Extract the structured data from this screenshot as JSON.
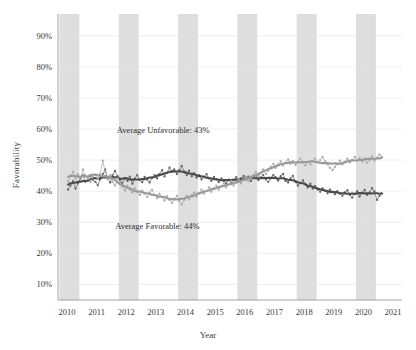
{
  "chart_data": {
    "type": "line",
    "title": "",
    "xlabel": "Year",
    "ylabel": "Favorability",
    "xlim": [
      2009.7,
      2021.3
    ],
    "ylim": [
      0.05,
      0.97
    ],
    "grid": true,
    "legend_position": "none",
    "ytick_labels": [
      "90%",
      "80%",
      "70%",
      "60%",
      "50%",
      "40%",
      "30%",
      "20%",
      "10%"
    ],
    "ytick_values": [
      0.9,
      0.8,
      0.7,
      0.6,
      0.5,
      0.4,
      0.3,
      0.2,
      0.1
    ],
    "xtick_labels": [
      "2010",
      "2011",
      "2012",
      "2013",
      "2014",
      "2015",
      "2016",
      "2017",
      "2018",
      "2019",
      "2020",
      "2021"
    ],
    "xtick_values": [
      2010,
      2011,
      2012,
      2013,
      2014,
      2015,
      2016,
      2017,
      2018,
      2019,
      2020,
      2021
    ],
    "shaded_bands": [
      {
        "start": 2009.75,
        "end": 2010.42
      },
      {
        "start": 2011.75,
        "end": 2012.42
      },
      {
        "start": 2013.75,
        "end": 2014.42
      },
      {
        "start": 2015.75,
        "end": 2016.42
      },
      {
        "start": 2017.75,
        "end": 2018.42
      },
      {
        "start": 2019.75,
        "end": 2020.42
      }
    ],
    "band_color": "#c9c9c9",
    "annotations": [
      {
        "text": "Average Unfavorable: 43%",
        "x": 2013.25,
        "y": 0.595
      },
      {
        "text": "Average Favorable: 44%",
        "x": 2013.05,
        "y": 0.285
      }
    ],
    "series": [
      {
        "name": "Unfavorable",
        "color": "#5d5d5d",
        "smooth_color": "#4a4a4a",
        "marker": "circle",
        "x": [
          2010.04,
          2010.12,
          2010.21,
          2010.29,
          2010.37,
          2010.46,
          2010.54,
          2010.62,
          2010.71,
          2010.79,
          2010.87,
          2010.96,
          2011.04,
          2011.12,
          2011.21,
          2011.29,
          2011.37,
          2011.46,
          2011.54,
          2011.62,
          2011.71,
          2011.79,
          2011.87,
          2011.96,
          2012.04,
          2012.12,
          2012.21,
          2012.29,
          2012.37,
          2012.46,
          2012.54,
          2012.62,
          2012.71,
          2012.79,
          2012.87,
          2012.96,
          2013.04,
          2013.12,
          2013.21,
          2013.29,
          2013.37,
          2013.46,
          2013.54,
          2013.62,
          2013.71,
          2013.79,
          2013.87,
          2013.96,
          2014.04,
          2014.12,
          2014.21,
          2014.29,
          2014.37,
          2014.46,
          2014.54,
          2014.62,
          2014.71,
          2014.79,
          2014.87,
          2014.96,
          2015.04,
          2015.12,
          2015.21,
          2015.29,
          2015.37,
          2015.46,
          2015.54,
          2015.62,
          2015.71,
          2015.79,
          2015.87,
          2015.96,
          2016.04,
          2016.12,
          2016.21,
          2016.29,
          2016.37,
          2016.46,
          2016.54,
          2016.62,
          2016.71,
          2016.79,
          2016.87,
          2016.96,
          2017.04,
          2017.12,
          2017.21,
          2017.29,
          2017.37,
          2017.46,
          2017.54,
          2017.62,
          2017.71,
          2017.79,
          2017.87,
          2017.96,
          2018.04,
          2018.12,
          2018.21,
          2018.29,
          2018.37,
          2018.46,
          2018.54,
          2018.62,
          2018.71,
          2018.79,
          2018.87,
          2018.96,
          2019.04,
          2019.12,
          2019.21,
          2019.29,
          2019.37,
          2019.46,
          2019.54,
          2019.62,
          2019.71,
          2019.79,
          2019.87,
          2019.96,
          2020.04,
          2020.12,
          2020.21,
          2020.29,
          2020.37,
          2020.46,
          2020.54,
          2020.62
        ],
        "y": [
          0.405,
          0.418,
          0.432,
          0.408,
          0.425,
          0.44,
          0.452,
          0.43,
          0.441,
          0.449,
          0.437,
          0.43,
          0.419,
          0.438,
          0.455,
          0.47,
          0.441,
          0.428,
          0.452,
          0.465,
          0.448,
          0.436,
          0.427,
          0.441,
          0.433,
          0.447,
          0.424,
          0.44,
          0.452,
          0.436,
          0.429,
          0.446,
          0.437,
          0.428,
          0.443,
          0.452,
          0.441,
          0.455,
          0.468,
          0.447,
          0.459,
          0.476,
          0.462,
          0.47,
          0.455,
          0.468,
          0.481,
          0.463,
          0.452,
          0.466,
          0.448,
          0.457,
          0.444,
          0.452,
          0.438,
          0.447,
          0.455,
          0.441,
          0.433,
          0.446,
          0.438,
          0.429,
          0.441,
          0.433,
          0.425,
          0.437,
          0.428,
          0.436,
          0.445,
          0.432,
          0.441,
          0.449,
          0.438,
          0.447,
          0.433,
          0.442,
          0.451,
          0.436,
          0.444,
          0.452,
          0.438,
          0.43,
          0.441,
          0.452,
          0.445,
          0.434,
          0.448,
          0.456,
          0.433,
          0.428,
          0.441,
          0.449,
          0.43,
          0.418,
          0.426,
          0.435,
          0.422,
          0.412,
          0.424,
          0.408,
          0.416,
          0.405,
          0.398,
          0.409,
          0.401,
          0.393,
          0.405,
          0.398,
          0.39,
          0.4,
          0.392,
          0.385,
          0.396,
          0.403,
          0.388,
          0.379,
          0.391,
          0.4,
          0.383,
          0.395,
          0.404,
          0.388,
          0.396,
          0.41,
          0.399,
          0.372,
          0.385,
          0.393
        ]
      },
      {
        "name": "Favorable",
        "color": "#a8a8a8",
        "smooth_color": "#999999",
        "marker": "circle",
        "x": [
          2010.04,
          2010.12,
          2010.21,
          2010.29,
          2010.37,
          2010.46,
          2010.54,
          2010.62,
          2010.71,
          2010.79,
          2010.87,
          2010.96,
          2011.04,
          2011.12,
          2011.21,
          2011.29,
          2011.37,
          2011.46,
          2011.54,
          2011.62,
          2011.71,
          2011.79,
          2011.87,
          2011.96,
          2012.04,
          2012.12,
          2012.21,
          2012.29,
          2012.37,
          2012.46,
          2012.54,
          2012.62,
          2012.71,
          2012.79,
          2012.87,
          2012.96,
          2013.04,
          2013.12,
          2013.21,
          2013.29,
          2013.37,
          2013.46,
          2013.54,
          2013.62,
          2013.71,
          2013.79,
          2013.87,
          2013.96,
          2014.04,
          2014.12,
          2014.21,
          2014.29,
          2014.37,
          2014.46,
          2014.54,
          2014.62,
          2014.71,
          2014.79,
          2014.87,
          2014.96,
          2015.04,
          2015.12,
          2015.21,
          2015.29,
          2015.37,
          2015.46,
          2015.54,
          2015.62,
          2015.71,
          2015.79,
          2015.87,
          2015.96,
          2016.04,
          2016.12,
          2016.21,
          2016.29,
          2016.37,
          2016.46,
          2016.54,
          2016.62,
          2016.71,
          2016.79,
          2016.87,
          2016.96,
          2017.04,
          2017.12,
          2017.21,
          2017.29,
          2017.37,
          2017.46,
          2017.54,
          2017.62,
          2017.71,
          2017.79,
          2017.87,
          2017.96,
          2018.04,
          2018.12,
          2018.21,
          2018.29,
          2018.37,
          2018.46,
          2018.54,
          2018.62,
          2018.71,
          2018.79,
          2018.87,
          2018.96,
          2019.04,
          2019.12,
          2019.21,
          2019.29,
          2019.37,
          2019.46,
          2019.54,
          2019.62,
          2019.71,
          2019.79,
          2019.87,
          2019.96,
          2020.04,
          2020.12,
          2020.21,
          2020.29,
          2020.37,
          2020.46,
          2020.54,
          2020.62
        ],
        "y": [
          0.432,
          0.448,
          0.462,
          0.441,
          0.455,
          0.438,
          0.47,
          0.452,
          0.441,
          0.43,
          0.445,
          0.452,
          0.44,
          0.455,
          0.498,
          0.462,
          0.441,
          0.452,
          0.43,
          0.418,
          0.441,
          0.429,
          0.415,
          0.402,
          0.418,
          0.405,
          0.396,
          0.41,
          0.398,
          0.388,
          0.402,
          0.392,
          0.381,
          0.395,
          0.404,
          0.388,
          0.378,
          0.392,
          0.381,
          0.37,
          0.384,
          0.372,
          0.362,
          0.375,
          0.385,
          0.368,
          0.357,
          0.372,
          0.385,
          0.374,
          0.388,
          0.396,
          0.382,
          0.393,
          0.405,
          0.392,
          0.4,
          0.412,
          0.398,
          0.408,
          0.418,
          0.405,
          0.415,
          0.425,
          0.412,
          0.422,
          0.432,
          0.418,
          0.428,
          0.438,
          0.425,
          0.436,
          0.445,
          0.432,
          0.442,
          0.452,
          0.462,
          0.448,
          0.458,
          0.47,
          0.455,
          0.466,
          0.478,
          0.488,
          0.475,
          0.486,
          0.496,
          0.482,
          0.492,
          0.502,
          0.488,
          0.497,
          0.485,
          0.495,
          0.505,
          0.492,
          0.483,
          0.494,
          0.486,
          0.497,
          0.505,
          0.492,
          0.5,
          0.51,
          0.496,
          0.486,
          0.475,
          0.468,
          0.478,
          0.488,
          0.498,
          0.486,
          0.495,
          0.505,
          0.492,
          0.5,
          0.51,
          0.497,
          0.506,
          0.496,
          0.505,
          0.492,
          0.5,
          0.512,
          0.498,
          0.508,
          0.518,
          0.51
        ]
      }
    ]
  }
}
